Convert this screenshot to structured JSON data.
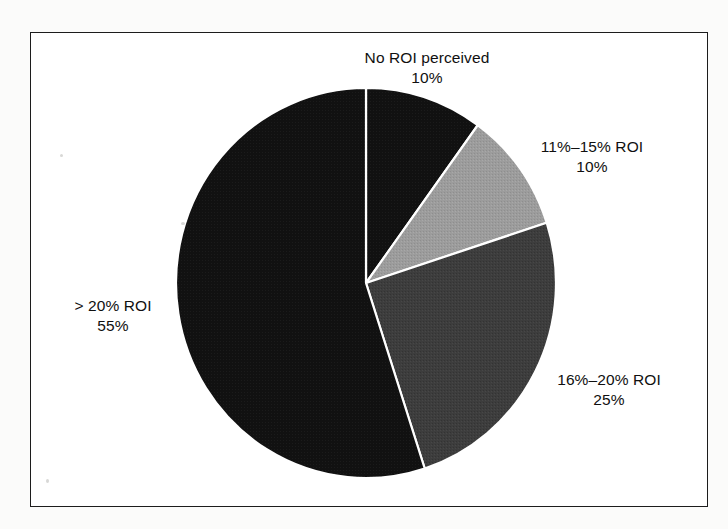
{
  "chart_data": {
    "type": "pie",
    "title": "",
    "subtitle": "",
    "xlabel": "",
    "ylabel": "",
    "legend_position": "none",
    "grid": false,
    "labels_outside": true,
    "start_angle_deg": 0,
    "direction": "clockwise",
    "categories": [
      "No ROI perceived",
      "11%–15% ROI",
      "16%–20% ROI",
      "> 20% ROI"
    ],
    "values": [
      10,
      10,
      25,
      55
    ],
    "value_labels": [
      "10%",
      "10%",
      "25%",
      "55%"
    ],
    "colors": [
      "#151515",
      "#9c9c9c",
      "#3d3d3d",
      "#0d0d0d"
    ],
    "slices": [
      {
        "name": "No ROI perceived",
        "value": 10,
        "value_label": "10%",
        "color": "#151515",
        "start_deg": 0,
        "end_deg": 36
      },
      {
        "name": "11%–15% ROI",
        "value": 10,
        "value_label": "10%",
        "color": "#9c9c9c",
        "start_deg": 36,
        "end_deg": 72
      },
      {
        "name": "16%–20% ROI",
        "value": 25,
        "value_label": "25%",
        "color": "#3d3d3d",
        "start_deg": 72,
        "end_deg": 162
      },
      {
        "name": "> 20% ROI",
        "value": 55,
        "value_label": "55%",
        "color": "#0d0d0d",
        "start_deg": 162,
        "end_deg": 360
      }
    ],
    "total": 100,
    "units": "percent"
  },
  "labels": {
    "no_roi": {
      "name": "No ROI perceived",
      "value": "10%"
    },
    "roi_11_15": {
      "name": "11%–15% ROI",
      "value": "10%"
    },
    "roi_16_20": {
      "name": "16%–20% ROI",
      "value": "25%"
    },
    "roi_gt_20": {
      "name": "> 20% ROI",
      "value": "55%"
    }
  },
  "style": {
    "frame_color": "#1c1c1c",
    "background": "#ffffff",
    "separator_color": "#ffffff"
  }
}
